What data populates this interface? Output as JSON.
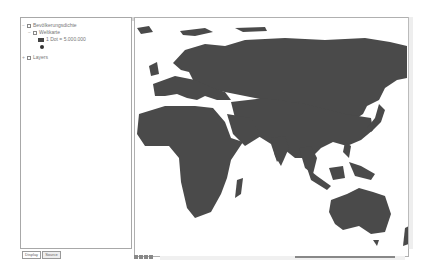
{
  "toc": {
    "items": [
      {
        "label": "Bevölkerungsdichte",
        "level": 0,
        "expanded": true,
        "checked": true
      },
      {
        "label": "Weltkarte",
        "level": 1,
        "expanded": true,
        "checked": true
      },
      {
        "legend_label": "1 Dot = 5.000.000",
        "symbol": "dot-swatch"
      },
      {
        "legend_symbol": "point"
      },
      {
        "label": "Layers",
        "level": 0,
        "expanded": true,
        "checked": true
      }
    ],
    "tabs": [
      "Display",
      "Source"
    ],
    "active_tab": "Display"
  },
  "map": {
    "land_color": "#4a4a4a",
    "background": "#ffffff",
    "content": "World map (Europe, Africa, Asia, Australia) dot density population"
  },
  "colors": {
    "land": "#4a4a4a",
    "panel_border": "#a8a8a8"
  }
}
